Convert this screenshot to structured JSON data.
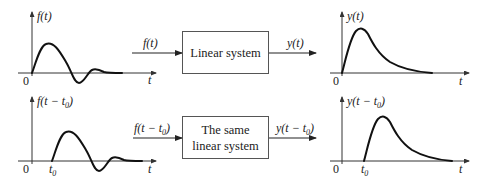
{
  "diagram": {
    "top_row": {
      "input_plot": {
        "y_label": "f(t)",
        "origin_label": "0",
        "x_label": "t"
      },
      "input_arrow_label": "f(t)",
      "system_box": {
        "lines": [
          "Linear system"
        ]
      },
      "output_arrow_label": "y(t)",
      "output_plot": {
        "y_label": "y(t)",
        "origin_label": "0",
        "x_label": "t"
      }
    },
    "bottom_row": {
      "input_plot": {
        "y_label": "f(t − t0)",
        "y_label_main": "f(t − t",
        "y_label_sub": "0",
        "y_label_close": ")",
        "origin_label": "0",
        "shift_label": "t",
        "shift_sub": "0",
        "x_label": "t"
      },
      "input_arrow_label": "f(t − t0)",
      "input_arrow_main": "f(t − t",
      "input_arrow_sub": "0",
      "input_arrow_close": ")",
      "system_box": {
        "lines": [
          "The same",
          "linear system"
        ]
      },
      "output_arrow_label": "y(t − t0)",
      "output_arrow_main": "y(t − t",
      "output_arrow_sub": "0",
      "output_arrow_close": ")",
      "output_plot": {
        "y_label": "y(t − t0)",
        "y_label_main": "y(t − t",
        "y_label_sub": "0",
        "y_label_close": ")",
        "origin_label": "0",
        "shift_label": "t",
        "shift_sub": "0",
        "x_label": "t"
      }
    },
    "colors": {
      "curve": "#111111",
      "axis": "#333333",
      "box_border": "#555555",
      "background": "#ffffff"
    }
  }
}
